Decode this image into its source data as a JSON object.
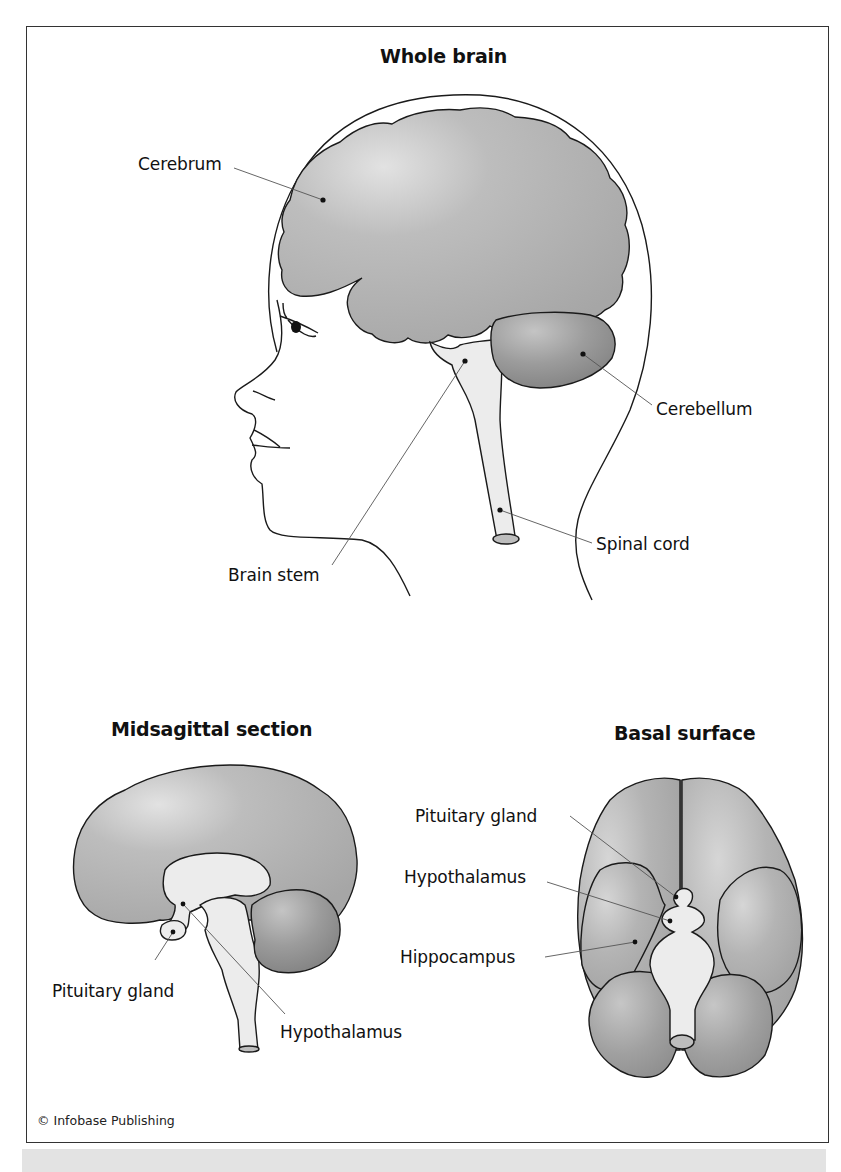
{
  "figure": {
    "colors": {
      "cerebrum": "#b3b3b3",
      "cerebrum_highlight": "#dedede",
      "cerebellum": "#969696",
      "brainstem": "#ececec",
      "outline": "#1a1a1a",
      "leader": "#555555",
      "footer_band": "#e3e3e3"
    },
    "panels": {
      "whole_brain": {
        "title": "Whole brain",
        "labels": {
          "cerebrum": "Cerebrum",
          "cerebellum": "Cerebellum",
          "spinal_cord": "Spinal cord",
          "brain_stem": "Brain stem"
        }
      },
      "midsagittal": {
        "title": "Midsagittal section",
        "labels": {
          "pituitary_gland": "Pituitary gland",
          "hypothalamus": "Hypothalamus"
        }
      },
      "basal": {
        "title": "Basal surface",
        "labels": {
          "pituitary_gland": "Pituitary gland",
          "hypothalamus": "Hypothalamus",
          "hippocampus": "Hippocampus"
        }
      }
    },
    "credit": "© Infobase Publishing"
  }
}
